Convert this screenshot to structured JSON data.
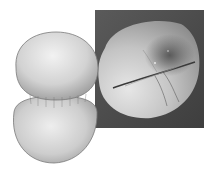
{
  "figure": {
    "model": {
      "label": "rendered-model",
      "colors": {
        "light": "#eeeeee",
        "mid": "#c8c8c8",
        "dark": "#8a8a8a",
        "outline": "#6a6a6a"
      }
    },
    "micrograph": {
      "label": "sem-micrograph",
      "colors": {
        "background": "#4e4e4e",
        "grain_light": "#dcdcdc",
        "grain_dark": "#6e6e6e",
        "fold": "#3a3a3a"
      }
    }
  }
}
